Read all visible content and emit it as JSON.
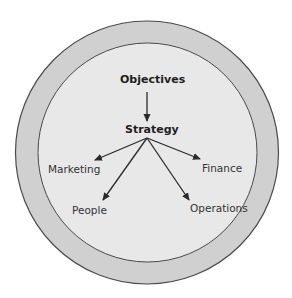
{
  "diagram": {
    "type": "concentric-circles-hierarchy",
    "colors": {
      "outer_ring": "#d0d0d0",
      "inner_circle": "#e8e8e8",
      "stroke": "#4a4a4a",
      "arrow": "#2a2a2a",
      "background": "#ffffff"
    },
    "top_node": {
      "label": "Objectives"
    },
    "middle_node": {
      "label": "Strategy"
    },
    "leaf_nodes": [
      {
        "id": "marketing",
        "label": "Marketing"
      },
      {
        "id": "finance",
        "label": "Finance"
      },
      {
        "id": "people",
        "label": "People"
      },
      {
        "id": "operations",
        "label": "Operations"
      }
    ],
    "edges": [
      {
        "from": "Objectives",
        "to": "Strategy"
      },
      {
        "from": "Strategy",
        "to": "Marketing"
      },
      {
        "from": "Strategy",
        "to": "Finance"
      },
      {
        "from": "Strategy",
        "to": "People"
      },
      {
        "from": "Strategy",
        "to": "Operations"
      }
    ]
  }
}
